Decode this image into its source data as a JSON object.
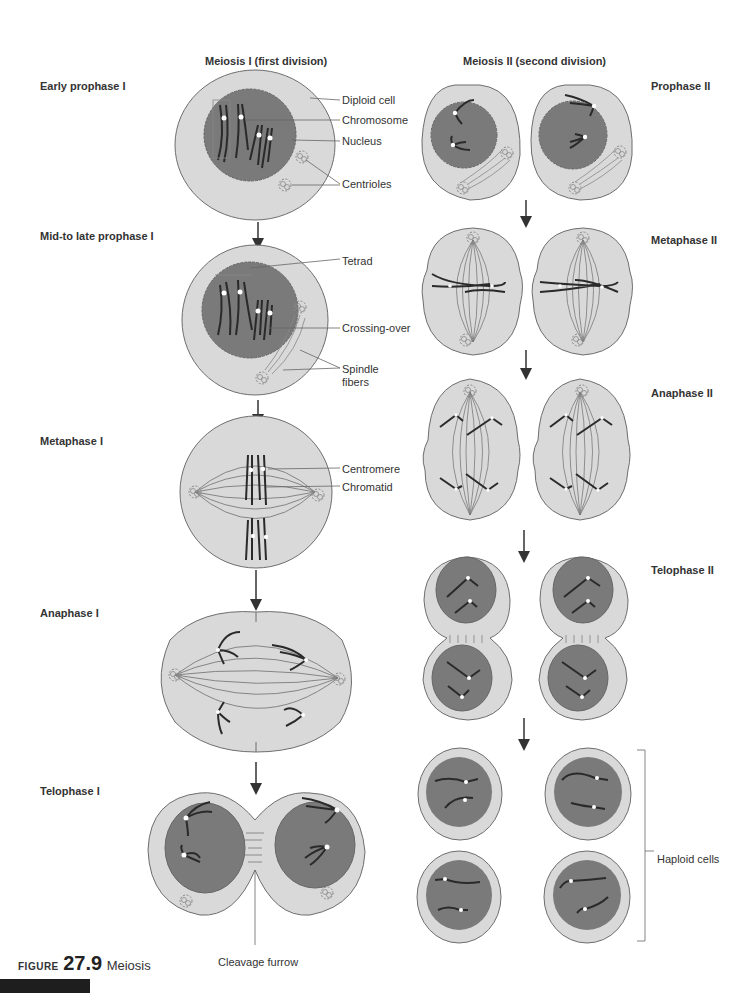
{
  "figure": {
    "label": "FIGURE",
    "number": "27.9",
    "title": "Meiosis"
  },
  "columns": {
    "meiosis1": "Meiosis I (first division)",
    "meiosis2": "Meiosis II (second division)"
  },
  "stages": {
    "early_prophase1": "Early prophase I",
    "mid_late_prophase1": "Mid-to late prophase I",
    "metaphase1": "Metaphase I",
    "anaphase1": "Anaphase I",
    "telophase1": "Telophase I",
    "prophase2": "Prophase II",
    "metaphase2": "Metaphase II",
    "anaphase2": "Anaphase II",
    "telophase2": "Telophase II"
  },
  "callouts": {
    "diploid_cell": "Diploid cell",
    "chromosome": "Chromosome",
    "nucleus": "Nucleus",
    "centrioles": "Centrioles",
    "tetrad": "Tetrad",
    "crossing_over": "Crossing-over",
    "spindle_fibers_1": "Spindle",
    "spindle_fibers_2": "fibers",
    "centromere": "Centromere",
    "chromatid": "Chromatid",
    "cleavage_furrow": "Cleavage furrow",
    "haploid_cells": "Haploid cells"
  },
  "colors": {
    "cytoplasm": "#d9d9d9",
    "nucleus": "#7a7a7a",
    "outline": "#6e6e6e",
    "chromosome": "#2a2a2a",
    "text": "#333333"
  }
}
